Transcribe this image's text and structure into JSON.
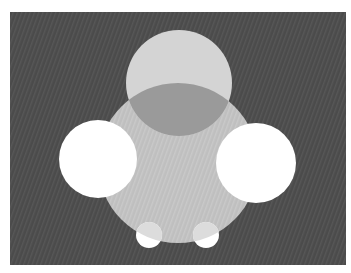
{
  "figure": {
    "colors": {
      "page": "#ffffff",
      "panel": "#4b4b4b",
      "panel_stripe": "#5a5a5a",
      "body_circle": "#bfbfbf",
      "top_circle": "#d4d4d4",
      "overlap_lens": "#9a9a9a",
      "white_circles": "#ffffff",
      "small_circle_shade": "#dcdcdc"
    },
    "shapes": [
      {
        "name": "body-circle"
      },
      {
        "name": "top-circle"
      },
      {
        "name": "overlap-lens"
      },
      {
        "name": "left-white-circle"
      },
      {
        "name": "right-white-circle"
      },
      {
        "name": "left-small-circle"
      },
      {
        "name": "right-small-circle"
      }
    ]
  }
}
